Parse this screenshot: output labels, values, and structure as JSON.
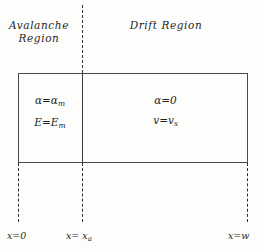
{
  "diagram": {
    "regions": [
      {
        "id": "avalanche",
        "label": "Avalanche\nRegion",
        "equations": [
          {
            "lhs": "α",
            "rel": "=",
            "rhs": "α",
            "sub": "m"
          },
          {
            "lhs": "E",
            "rel": "=",
            "rhs": "E",
            "sub": "m"
          }
        ]
      },
      {
        "id": "drift",
        "label": "Drift  Region",
        "equations": [
          {
            "lhs": "α",
            "rel": "=",
            "rhs": "0",
            "sub": ""
          },
          {
            "lhs": "v",
            "rel": "=",
            "rhs": "v",
            "sub": "s"
          }
        ]
      }
    ],
    "equation_text": {
      "alpha_m": "α=α",
      "alpha_m_sub": "m",
      "E_m": "E=E",
      "E_m_sub": "m",
      "alpha_zero": "α=0",
      "v_s": "v=v",
      "v_s_sub": "s"
    },
    "axis": {
      "label_x0": "x=0",
      "label_xa": "x= x",
      "label_xa_sub": "a",
      "label_w": "x=w"
    },
    "colors": {
      "background": "#fdfdfb",
      "line": "#4a4a4a",
      "divider": "#3c3c3c",
      "dash": "#2e2e2e",
      "text": "#1f1f1f"
    }
  }
}
